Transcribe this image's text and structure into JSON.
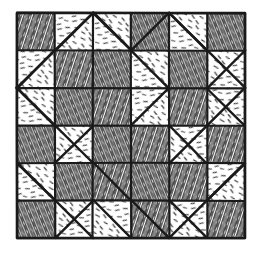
{
  "document": {
    "title": "Quilt Block Pattern Diagram",
    "caption": "",
    "background_color": "#ffffff",
    "ink_color": "#1a1a1a"
  },
  "canvas": {
    "width": 258,
    "height": 255
  },
  "quilt": {
    "name": "quilt-diagram",
    "grid_columns": 6,
    "grid_rows": 6,
    "origin_x": 17,
    "origin_y": 13,
    "cell_width": 38,
    "cell_height": 37.5,
    "border_label": "outer frame",
    "outer_border_width": 2.6,
    "grid_line_width": 2.2,
    "diagonal_line_width": 2.4,
    "fill_styles": {
      "dark_label": "dense-hatch-fabric",
      "light_label": "sparse-stipple-fabric",
      "dark_color": "#2b2b2b",
      "light_color": "#333333"
    },
    "cells": [
      {
        "row": 0,
        "col": 0,
        "type": "full",
        "fill": "dark"
      },
      {
        "row": 0,
        "col": 1,
        "type": "diag-bl-tr",
        "top_left": "light",
        "bottom_right": "light"
      },
      {
        "row": 0,
        "col": 2,
        "type": "diag-tl-br",
        "top_right": "light",
        "bottom_left": "light"
      },
      {
        "row": 0,
        "col": 3,
        "type": "full",
        "fill": "dark"
      },
      {
        "row": 0,
        "col": 4,
        "type": "diag-tl-br",
        "top_right": "light",
        "bottom_left": "light"
      },
      {
        "row": 0,
        "col": 5,
        "type": "full",
        "fill": "dark"
      },
      {
        "row": 1,
        "col": 0,
        "type": "diag-bl-tr",
        "top_left": "light",
        "bottom_right": "light"
      },
      {
        "row": 1,
        "col": 1,
        "type": "full",
        "fill": "dark"
      },
      {
        "row": 1,
        "col": 2,
        "type": "full",
        "fill": "dark"
      },
      {
        "row": 1,
        "col": 3,
        "type": "diag-tl-br",
        "top_right": "light",
        "bottom_left": "light"
      },
      {
        "row": 1,
        "col": 4,
        "type": "full",
        "fill": "dark"
      },
      {
        "row": 1,
        "col": 5,
        "type": "diag-bl-tr",
        "top_left": "light",
        "bottom_right": "light"
      },
      {
        "row": 2,
        "col": 0,
        "type": "diag-tl-br",
        "top_right": "light",
        "bottom_left": "light"
      },
      {
        "row": 2,
        "col": 1,
        "type": "full",
        "fill": "dark"
      },
      {
        "row": 2,
        "col": 2,
        "type": "full",
        "fill": "dark"
      },
      {
        "row": 2,
        "col": 3,
        "type": "diag-bl-tr",
        "top_left": "light",
        "bottom_right": "light"
      },
      {
        "row": 2,
        "col": 4,
        "type": "full",
        "fill": "dark"
      },
      {
        "row": 2,
        "col": 5,
        "type": "diag-tl-br",
        "top_right": "light",
        "bottom_left": "light"
      },
      {
        "row": 3,
        "col": 0,
        "type": "full",
        "fill": "dark"
      },
      {
        "row": 3,
        "col": 1,
        "type": "diag-bl-tr",
        "top_left": "light",
        "bottom_right": "light"
      },
      {
        "row": 3,
        "col": 2,
        "type": "full",
        "fill": "dark"
      },
      {
        "row": 3,
        "col": 3,
        "type": "full",
        "fill": "dark"
      },
      {
        "row": 3,
        "col": 4,
        "type": "diag-tl-br",
        "top_right": "light",
        "bottom_left": "light"
      },
      {
        "row": 3,
        "col": 5,
        "type": "full",
        "fill": "dark"
      },
      {
        "row": 4,
        "col": 0,
        "type": "diag-tl-br",
        "top_right": "light",
        "bottom_left": "light"
      },
      {
        "row": 4,
        "col": 1,
        "type": "full",
        "fill": "dark"
      },
      {
        "row": 4,
        "col": 2,
        "type": "full",
        "fill": "dark"
      },
      {
        "row": 4,
        "col": 3,
        "type": "full",
        "fill": "dark"
      },
      {
        "row": 4,
        "col": 4,
        "type": "full",
        "fill": "dark"
      },
      {
        "row": 4,
        "col": 5,
        "type": "diag-bl-tr",
        "top_left": "light",
        "bottom_right": "light"
      },
      {
        "row": 5,
        "col": 0,
        "type": "full",
        "fill": "dark"
      },
      {
        "row": 5,
        "col": 1,
        "type": "diag-bl-tr",
        "top_left": "light",
        "bottom_right": "light"
      },
      {
        "row": 5,
        "col": 2,
        "type": "diag-tl-br",
        "top_right": "light",
        "bottom_left": "light"
      },
      {
        "row": 5,
        "col": 3,
        "type": "full",
        "fill": "dark"
      },
      {
        "row": 5,
        "col": 4,
        "type": "diag-tl-br",
        "top_right": "light",
        "bottom_left": "light"
      },
      {
        "row": 5,
        "col": 5,
        "type": "full",
        "fill": "dark"
      }
    ],
    "long_diagonals": [
      {
        "name": "block-tl-star-diag-1",
        "x1": 17,
        "y1": 88,
        "x2": 93,
        "y2": 13
      },
      {
        "name": "block-tl-star-diag-2",
        "x1": 17,
        "y1": 88,
        "x2": 93,
        "y2": 163
      },
      {
        "name": "block-tl-star-diag-3",
        "x1": 93,
        "y1": 13,
        "x2": 131,
        "y2": 50
      },
      {
        "name": "block-tr-star-diag-1",
        "x1": 131,
        "y1": 50,
        "x2": 169,
        "y2": 13
      },
      {
        "name": "block-tr-star-diag-2",
        "x1": 169,
        "y1": 13,
        "x2": 245,
        "y2": 88
      },
      {
        "name": "block-tr-star-diag-3",
        "x1": 169,
        "y1": 163,
        "x2": 245,
        "y2": 88
      },
      {
        "name": "block-bl-star-diag-1",
        "x1": 17,
        "y1": 163,
        "x2": 93,
        "y2": 238
      },
      {
        "name": "block-bl-star-diag-2",
        "x1": 93,
        "y1": 163,
        "x2": 131,
        "y2": 200
      },
      {
        "name": "block-br-star-diag-1",
        "x1": 131,
        "y1": 200,
        "x2": 169,
        "y2": 238
      },
      {
        "name": "block-br-star-diag-2",
        "x1": 169,
        "y1": 238,
        "x2": 245,
        "y2": 163
      }
    ]
  },
  "chart_data": {
    "type": "diagram",
    "title": "Quilt Block Pattern Diagram",
    "grid": "6x6",
    "dark_squares": 20,
    "light_diagonal_squares": 16
  }
}
